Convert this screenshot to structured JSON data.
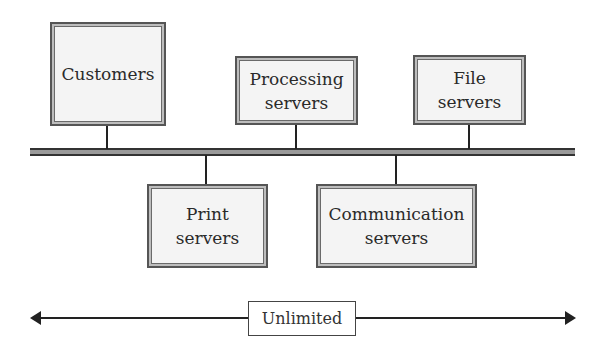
{
  "diagram": {
    "type": "bus-network",
    "nodes_top": [
      {
        "id": "customers",
        "lines": [
          "Customers"
        ]
      },
      {
        "id": "processing-servers",
        "lines": [
          "Processing",
          "servers"
        ]
      },
      {
        "id": "file-servers",
        "lines": [
          "File",
          "servers"
        ]
      }
    ],
    "nodes_bottom": [
      {
        "id": "print-servers",
        "lines": [
          "Print",
          "servers"
        ]
      },
      {
        "id": "communication-servers",
        "lines": [
          "Communication",
          "servers"
        ]
      }
    ],
    "scale_label": "Unlimited"
  }
}
